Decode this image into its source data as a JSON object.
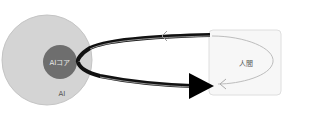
{
  "diagram": {
    "outer_circle": {
      "label": "AI",
      "fill": "#d4d4d4",
      "stroke": "#c2c2c2"
    },
    "inner_circle": {
      "label": "AIコア",
      "fill": "#6e6e6e"
    },
    "human_box": {
      "label": "人間",
      "fill": "#f7f7f7",
      "stroke": "#dddddd"
    },
    "loop_arrow": {
      "color": "#111111"
    },
    "inner_loop": {
      "color": "#bbbbbb"
    }
  }
}
